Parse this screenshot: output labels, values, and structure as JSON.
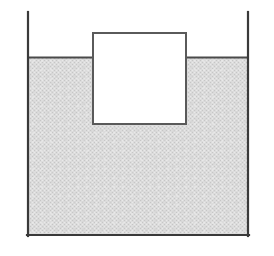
{
  "figure": {
    "name": "buoyancy-floating-block-diagram",
    "type": "physics-schematic",
    "title": "",
    "caption": "",
    "width": 274,
    "height": 256,
    "background_color": "#ffffff"
  },
  "colors": {
    "outline": "#3a3a3a",
    "outline_light": "#6e6e6e",
    "liquid_fill": "#d9d9d9",
    "liquid_dither_light": "#e8e8e8",
    "liquid_dither_dark": "#c9c9c9",
    "block_fill": "#ffffff",
    "block_outline": "#5a5a5a",
    "page_background": "#ffffff"
  },
  "container": {
    "label": "container",
    "left_wall_x": 27,
    "right_wall_x": 249,
    "bottom_y": 235,
    "wall_top_y": 12,
    "wall_thickness": 2,
    "open_top": true
  },
  "liquid": {
    "label": "liquid",
    "surface_y": 57,
    "bottom_y": 235,
    "left_x": 27,
    "right_x": 249,
    "fill_style": "dithered-halftone-gray",
    "surface_line_thickness": 2
  },
  "block": {
    "label": "block",
    "left_x": 93,
    "right_x": 186,
    "top_y": 33,
    "bottom_y": 124,
    "width": 93,
    "height": 91,
    "outline_thickness": 2,
    "submerged_depth": 67,
    "emergent_height": 24,
    "submerged_fraction": "0.74"
  },
  "annotations": []
}
